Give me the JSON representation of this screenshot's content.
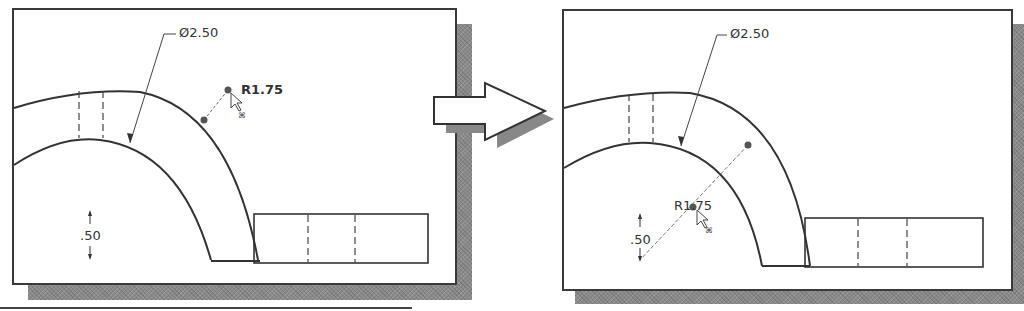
{
  "before_panel": {
    "dimensions": {
      "diameter": "Ø2.50",
      "radius": "R1.75",
      "thickness": ".50"
    },
    "cursor": "arrow-with-move-icon"
  },
  "transition_arrow": {
    "icon": "right-arrow-icon"
  },
  "after_panel": {
    "dimensions": {
      "diameter": "Ø2.50",
      "radius": "R1.75",
      "thickness": ".50"
    },
    "cursor": "arrow-with-move-icon"
  },
  "colors": {
    "line": "#333333",
    "shadow": "#8a8a8a",
    "background": "#ffffff"
  }
}
